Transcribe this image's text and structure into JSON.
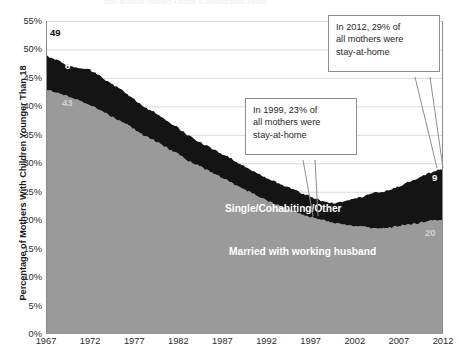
{
  "ghost_text": "stay-at-home mothers  •  social & demographic trends",
  "axes": {
    "y_title": "Percentage of Mothers With Children Younger Than 18",
    "y_ticks": [
      "55%",
      "50%",
      "45%",
      "40%",
      "35%",
      "30%",
      "25%",
      "20%",
      "15%",
      "10%",
      "5%",
      "0%"
    ],
    "x_ticks": [
      "1967",
      "1972",
      "1977",
      "1982",
      "1987",
      "1992",
      "1997",
      "2002",
      "2007",
      "2012"
    ]
  },
  "series_labels": {
    "top": "Single/Cohabiting/Other",
    "bottom": "Married with working husband"
  },
  "point_labels": {
    "start_total": "49",
    "start_top": "6",
    "start_bottom": "43",
    "end_top": "9",
    "end_bottom": "20"
  },
  "callouts": [
    {
      "name": "callout-2012",
      "lines": [
        "In 2012, 29% of",
        "all mothers were",
        "stay-at-home"
      ]
    },
    {
      "name": "callout-1999",
      "lines": [
        "In 1999, 23% of",
        "all mothers were",
        "stay-at-home"
      ]
    }
  ],
  "colors": {
    "married_fill": "#9a9a9a",
    "single_fill": "#141414",
    "gridline": "#d9d9d9",
    "axis": "#8a8a8a",
    "text": "#2b2b2b"
  },
  "chart_data": {
    "type": "area",
    "title": "",
    "subtitle": "",
    "xlabel": "",
    "ylabel": "Percentage of Mothers With Children Younger Than 18",
    "ylim": [
      0,
      55
    ],
    "xlim": [
      1967,
      2012
    ],
    "ytick_step": 5,
    "grid": true,
    "stacked": true,
    "legend": "in-plot labels",
    "annotations": [
      "In 2012, 29% of all mothers were stay-at-home",
      "In 1999, 23% of all mothers were stay-at-home",
      "49",
      "6",
      "43",
      "9",
      "20"
    ],
    "x": [
      1967,
      1968,
      1969,
      1970,
      1971,
      1972,
      1973,
      1974,
      1975,
      1976,
      1977,
      1978,
      1979,
      1980,
      1981,
      1982,
      1983,
      1984,
      1985,
      1986,
      1987,
      1988,
      1989,
      1990,
      1991,
      1992,
      1993,
      1994,
      1995,
      1996,
      1997,
      1998,
      1999,
      2000,
      2001,
      2002,
      2003,
      2004,
      2005,
      2006,
      2007,
      2008,
      2009,
      2010,
      2011,
      2012
    ],
    "series": [
      {
        "name": "Married with working husband",
        "values": [
          43,
          42.5,
          42,
          41.5,
          41,
          40.2,
          39.5,
          38.6,
          37.8,
          37,
          36,
          35,
          34.2,
          33.4,
          32.4,
          31.6,
          30.6,
          29.8,
          29,
          28.2,
          27.4,
          26.6,
          25.8,
          25,
          24.2,
          23.4,
          22.8,
          22.2,
          21.6,
          21,
          20.6,
          20.2,
          19.8,
          19.4,
          19.2,
          19,
          18.8,
          18.7,
          18.6,
          18.7,
          19,
          19.2,
          19.4,
          19.8,
          20,
          20
        ]
      },
      {
        "name": "Single/Cohabiting/Other",
        "values": [
          6,
          5.8,
          5.5,
          5.4,
          5.6,
          6.2,
          6,
          5.8,
          5.6,
          5.4,
          5.2,
          5.0,
          5.0,
          4.9,
          4.8,
          4.6,
          4.4,
          4.3,
          4.2,
          4.2,
          4.2,
          4.2,
          4.1,
          4.0,
          4.0,
          4.0,
          3.9,
          3.8,
          3.8,
          3.7,
          3.5,
          3.3,
          3.2,
          3.6,
          4.2,
          4.8,
          5.4,
          6.0,
          6.4,
          6.6,
          7.0,
          7.4,
          7.8,
          8.2,
          8.6,
          9.0
        ]
      }
    ],
    "totals_note": [
      49,
      23,
      29
    ]
  }
}
